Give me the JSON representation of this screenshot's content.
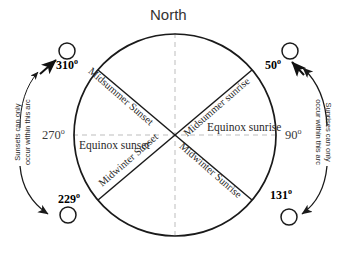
{
  "diagram": {
    "title": "North",
    "colors": {
      "stroke": "#1a1a1a",
      "dashed_axis": "#b9b9b9",
      "text": "#1a1a1a",
      "background": "#ffffff"
    },
    "cardinal": {
      "north_label": "North",
      "west_degrees": "270",
      "east_degrees": "90",
      "degree_symbol": "o"
    },
    "bearings": [
      {
        "id": "midsummer-sunset",
        "value": "310",
        "degree_symbol": "o",
        "position": "upper-left"
      },
      {
        "id": "midsummer-sunrise",
        "value": "50",
        "degree_symbol": "o",
        "position": "upper-right"
      },
      {
        "id": "midwinter-sunset",
        "value": "229",
        "degree_symbol": "o",
        "position": "lower-left"
      },
      {
        "id": "midwinter-sunrise",
        "value": "131",
        "degree_symbol": "o",
        "position": "lower-right"
      }
    ],
    "diagonal_labels": {
      "midsummer_sunset": "Midsummer Sunset",
      "midsummer_sunrise": "Midsummer sunrise",
      "midwinter_sunset": "Midwinter Sunset",
      "midwinter_sunrise": "Midwinter Sunrise"
    },
    "equinox_labels": {
      "sunset": "Equinox sunset",
      "sunrise": "Equinox sunrise"
    },
    "arc_notes": {
      "left_line1": "Sunsets can only",
      "left_line2": "occur within this arc",
      "right_line1": "Sunrises can only",
      "right_line2": "occur within this arc"
    },
    "sun_markers": [
      {
        "id": "sun-upper-left",
        "cx": 67,
        "cy": 51
      },
      {
        "id": "sun-upper-right",
        "cx": 290,
        "cy": 51
      },
      {
        "id": "sun-lower-left",
        "cx": 68,
        "cy": 215
      },
      {
        "id": "sun-lower-right",
        "cx": 289,
        "cy": 217
      }
    ],
    "horizon_circle": {
      "cx": 175,
      "cy": 135,
      "r": 101
    }
  }
}
